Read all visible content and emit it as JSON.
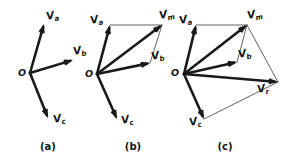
{
  "figure": {
    "background_color": "#ffffff",
    "ink_color": "#141414",
    "thin_line_color": "#3a3a3a"
  },
  "chart_data": {
    "type": "diagram",
    "panels": [
      {
        "id": "a",
        "caption": "(a)",
        "caption_pos": [
          48,
          150
        ],
        "origin_label": "O",
        "origin_label_pos": [
          18,
          76
        ],
        "origin": [
          30,
          73
        ],
        "vectors": [
          {
            "name": "Va",
            "base": "V",
            "sub": "a",
            "style": "bold",
            "from": [
              30,
              73
            ],
            "to": [
              44,
              24
            ],
            "label_pos": [
              47,
              20
            ]
          },
          {
            "name": "Vb",
            "base": "V",
            "sub": "b",
            "style": "bold",
            "from": [
              30,
              73
            ],
            "to": [
              73,
              60
            ],
            "label_pos": [
              74,
              55
            ]
          },
          {
            "name": "Vc",
            "base": "V",
            "sub": "c",
            "style": "bold",
            "from": [
              30,
              73
            ],
            "to": [
              48,
              118
            ],
            "label_pos": [
              54,
              123
            ]
          }
        ],
        "thin_lines": []
      },
      {
        "id": "b",
        "caption": "(b)",
        "caption_pos": [
          133,
          150
        ],
        "origin_label": "O",
        "origin_label_pos": [
          85,
          77
        ],
        "origin": [
          97,
          74
        ],
        "vectors": [
          {
            "name": "Va",
            "base": "V",
            "sub": "a",
            "style": "bold",
            "from": [
              97,
              74
            ],
            "to": [
              110,
              25
            ],
            "label_pos": [
              91,
              24
            ]
          },
          {
            "name": "Vb",
            "base": "V",
            "sub": "b",
            "style": "bold",
            "from": [
              97,
              74
            ],
            "to": [
              150,
              63
            ],
            "label_pos": [
              152,
              60
            ]
          },
          {
            "name": "Vc",
            "base": "V",
            "sub": "c",
            "style": "bold",
            "from": [
              97,
              74
            ],
            "to": [
              117,
              119
            ],
            "label_pos": [
              122,
              124
            ]
          },
          {
            "name": "Vm",
            "base": "V",
            "sub": "m",
            "style": "bold",
            "from": [
              97,
              74
            ],
            "to": [
              162,
              25
            ],
            "label_pos": [
              160,
              19
            ]
          }
        ],
        "thin_lines": [
          {
            "from": [
              110,
              25
            ],
            "to": [
              162,
              25
            ],
            "arrow": false
          },
          {
            "from": [
              150,
              63
            ],
            "to": [
              162,
              25
            ],
            "arrow": false
          }
        ]
      },
      {
        "id": "c",
        "caption": "(c)",
        "caption_pos": [
          225,
          150
        ],
        "origin_label": "O",
        "origin_label_pos": [
          171,
          76
        ],
        "origin": [
          184,
          74
        ],
        "vectors": [
          {
            "name": "Va",
            "base": "V",
            "sub": "a",
            "style": "bold",
            "from": [
              184,
              74
            ],
            "to": [
              196,
              25
            ],
            "label_pos": [
              180,
              24
            ]
          },
          {
            "name": "Vb",
            "base": "V",
            "sub": "b",
            "style": "bold",
            "from": [
              184,
              74
            ],
            "to": [
              237,
              62
            ],
            "label_pos": [
              239,
              58
            ]
          },
          {
            "name": "Vc",
            "base": "V",
            "sub": "c",
            "style": "bold",
            "from": [
              184,
              74
            ],
            "to": [
              204,
              119
            ],
            "label_pos": [
              190,
              126
            ]
          },
          {
            "name": "Vm",
            "base": "V",
            "sub": "m",
            "style": "bold",
            "from": [
              184,
              74
            ],
            "to": [
              247,
              25
            ],
            "label_pos": [
              248,
              19
            ]
          },
          {
            "name": "Vr",
            "base": "V",
            "sub": "r",
            "style": "bold",
            "from": [
              184,
              74
            ],
            "to": [
              278,
              82
            ],
            "label_pos": [
              258,
              93
            ]
          }
        ],
        "thin_lines": [
          {
            "from": [
              196,
              25
            ],
            "to": [
              247,
              25
            ],
            "arrow": false
          },
          {
            "from": [
              237,
              62
            ],
            "to": [
              247,
              25
            ],
            "arrow": false
          },
          {
            "from": [
              247,
              25
            ],
            "to": [
              278,
              82
            ],
            "arrow": false
          },
          {
            "from": [
              204,
              119
            ],
            "to": [
              278,
              82
            ],
            "arrow": false
          }
        ]
      }
    ]
  }
}
